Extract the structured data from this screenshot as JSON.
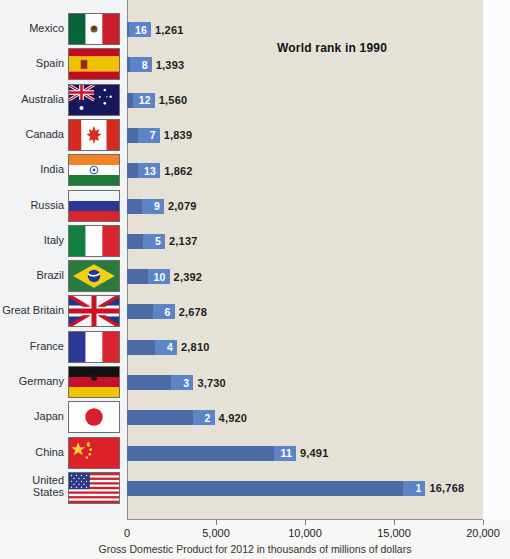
{
  "chart_data": {
    "type": "bar",
    "orientation": "horizontal",
    "title": "",
    "annotation": "World rank in 1990",
    "xlabel": "Gross Domestic Product for 2012 in thousands of millions of dollars",
    "ylabel": "",
    "xlim": [
      0,
      20000
    ],
    "xticks": [
      0,
      5000,
      10000,
      15000,
      20000
    ],
    "xtick_labels": [
      "0",
      "5,000",
      "10,000",
      "15,000",
      "20,000"
    ],
    "grid": false,
    "legend": null,
    "bar_color": "#4c6ba5",
    "badge_color": "#5d84c6",
    "plot_background": "#e5e1d6",
    "categories": [
      "Mexico",
      "Spain",
      "Australia",
      "Canada",
      "India",
      "Russia",
      "Italy",
      "Brazil",
      "Great Britain",
      "France",
      "Germany",
      "Japan",
      "China",
      "United States"
    ],
    "values": [
      1261,
      1393,
      1560,
      1839,
      1862,
      2079,
      2137,
      2392,
      2678,
      2810,
      3730,
      4920,
      9491,
      16768
    ],
    "value_labels": [
      "1,261",
      "1,393",
      "1,560",
      "1,839",
      "1,862",
      "2,079",
      "2,137",
      "2,392",
      "2,678",
      "2,810",
      "3,730",
      "4,920",
      "9,491",
      "16,768"
    ],
    "rank_1990": [
      16,
      8,
      12,
      7,
      13,
      9,
      5,
      10,
      6,
      4,
      3,
      2,
      11,
      1
    ],
    "rank_labels": [
      "16",
      "8",
      "12",
      "7",
      "13",
      "9",
      "5",
      "10",
      "6",
      "4",
      "3",
      "2",
      "11",
      "1"
    ]
  },
  "rows": [
    {
      "country": "Mexico",
      "country_line1": "Mexico",
      "country_line2": "",
      "flag": "mexico-flag",
      "rank": "16",
      "value": "1,261"
    },
    {
      "country": "Spain",
      "country_line1": "Spain",
      "country_line2": "",
      "flag": "spain-flag",
      "rank": "8",
      "value": "1,393"
    },
    {
      "country": "Australia",
      "country_line1": "Australia",
      "country_line2": "",
      "flag": "australia-flag",
      "rank": "12",
      "value": "1,560"
    },
    {
      "country": "Canada",
      "country_line1": "Canada",
      "country_line2": "",
      "flag": "canada-flag",
      "rank": "7",
      "value": "1,839"
    },
    {
      "country": "India",
      "country_line1": "India",
      "country_line2": "",
      "flag": "india-flag",
      "rank": "13",
      "value": "1,862"
    },
    {
      "country": "Russia",
      "country_line1": "Russia",
      "country_line2": "",
      "flag": "russia-flag",
      "rank": "9",
      "value": "2,079"
    },
    {
      "country": "Italy",
      "country_line1": "Italy",
      "country_line2": "",
      "flag": "italy-flag",
      "rank": "5",
      "value": "2,137"
    },
    {
      "country": "Brazil",
      "country_line1": "Brazil",
      "country_line2": "",
      "flag": "brazil-flag",
      "rank": "10",
      "value": "2,392"
    },
    {
      "country": "Great Britain",
      "country_line1": "Great Britain",
      "country_line2": "",
      "flag": "great-britain-flag",
      "rank": "6",
      "value": "2,678"
    },
    {
      "country": "France",
      "country_line1": "France",
      "country_line2": "",
      "flag": "france-flag",
      "rank": "4",
      "value": "2,810"
    },
    {
      "country": "Germany",
      "country_line1": "Germany",
      "country_line2": "",
      "flag": "germany-flag",
      "rank": "3",
      "value": "3,730"
    },
    {
      "country": "Japan",
      "country_line1": "Japan",
      "country_line2": "",
      "flag": "japan-flag",
      "rank": "2",
      "value": "4,920"
    },
    {
      "country": "China",
      "country_line1": "China",
      "country_line2": "",
      "flag": "china-flag",
      "rank": "11",
      "value": "9,491"
    },
    {
      "country": "United States",
      "country_line1": "United",
      "country_line2": "States",
      "flag": "united-states-flag",
      "rank": "1",
      "value": "16,768"
    }
  ],
  "annotation": {
    "text": "World rank in 1990"
  },
  "axis": {
    "caption": "Gross Domestic Product for 2012 in thousands of millions of dollars",
    "ticks": [
      "0",
      "5,000",
      "10,000",
      "15,000",
      "20,000"
    ]
  }
}
